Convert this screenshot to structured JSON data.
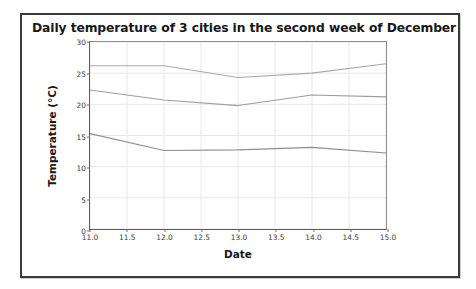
{
  "figure": {
    "title": "Daily temperature of 3 cities in the second week of December",
    "background_color": "#ffffff",
    "frame_color": "#3a3a3a"
  },
  "axes": {
    "xlabel": "Date",
    "ylabel": "Temperature (°C)",
    "xticks": [
      "11.0",
      "11.5",
      "12.0",
      "12.5",
      "13.0",
      "13.5",
      "14.0",
      "14.5",
      "15.0"
    ],
    "yticks": [
      "0",
      "5",
      "10",
      "15",
      "20",
      "25",
      "30"
    ],
    "grid_color": "#e8e8e8",
    "axis_color": "#5c5c5c"
  },
  "chart_data": {
    "type": "line",
    "title": "Daily temperature of 3 cities in the second week of December",
    "xlabel": "Date",
    "ylabel": "Temperature (°C)",
    "x": [
      11.0,
      12.0,
      13.0,
      14.0,
      15.0
    ],
    "xlim": [
      11.0,
      15.0
    ],
    "ylim": [
      0,
      30
    ],
    "xtick_values": [
      11.0,
      11.5,
      12.0,
      12.5,
      13.0,
      13.5,
      14.0,
      14.5,
      15.0
    ],
    "ytick_values": [
      0,
      5,
      10,
      15,
      20,
      25,
      30
    ],
    "grid": true,
    "legend": false,
    "series": [
      {
        "name": "city-1",
        "values": [
          26.2,
          26.2,
          24.3,
          25.0,
          26.5
        ],
        "color": "#a9a9a9"
      },
      {
        "name": "city-2",
        "values": [
          22.3,
          20.7,
          19.8,
          21.5,
          21.2
        ],
        "color": "#9d9d9d"
      },
      {
        "name": "city-3",
        "values": [
          15.3,
          12.6,
          12.7,
          13.1,
          12.2
        ],
        "color": "#8e8e8e"
      }
    ]
  }
}
